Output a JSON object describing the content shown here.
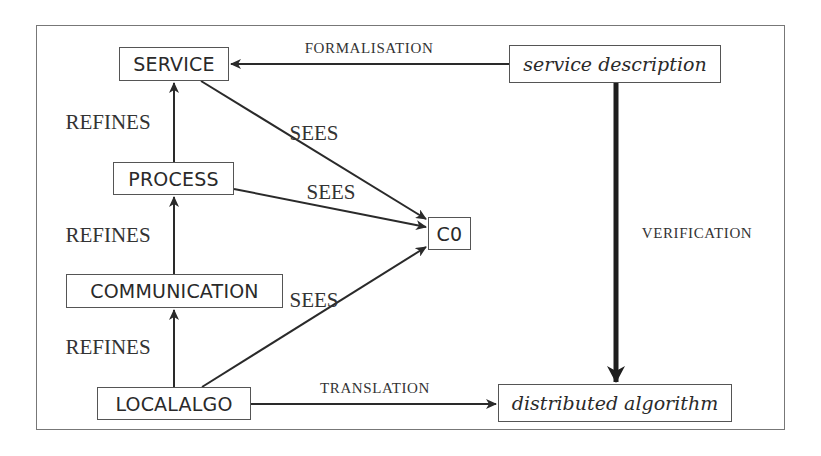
{
  "diagram": {
    "type": "refinement-architecture",
    "nodes": {
      "service": "SERVICE",
      "process": "PROCESS",
      "communication": "COMMUNICATION",
      "localalgo": "LOCALALGO",
      "c0": "C0",
      "service_description": "service description",
      "distributed_algorithm": "distributed algorithm"
    },
    "edge_labels": {
      "refines_1": "REFINES",
      "refines_2": "REFINES",
      "refines_3": "REFINES",
      "sees_1": "SEES",
      "sees_2": "SEES",
      "sees_3": "SEES",
      "formalisation": "FORMALISATION",
      "verification": "VERIFICATION",
      "translation": "TRANSLATION"
    },
    "edges": [
      {
        "from": "PROCESS",
        "to": "SERVICE",
        "label": "REFINES"
      },
      {
        "from": "COMMUNICATION",
        "to": "PROCESS",
        "label": "REFINES"
      },
      {
        "from": "LOCALALGO",
        "to": "COMMUNICATION",
        "label": "REFINES"
      },
      {
        "from": "SERVICE",
        "to": "C0",
        "label": "SEES"
      },
      {
        "from": "PROCESS",
        "to": "C0",
        "label": "SEES"
      },
      {
        "from": "LOCALALGO",
        "to": "C0",
        "label": "SEES"
      },
      {
        "from": "service description",
        "to": "SERVICE",
        "label": "FORMALISATION"
      },
      {
        "from": "service description",
        "to": "distributed algorithm",
        "label": "VERIFICATION"
      },
      {
        "from": "LOCALALGO",
        "to": "distributed algorithm",
        "label": "TRANSLATION"
      }
    ],
    "colors": {
      "stroke": "#2a2a2a",
      "border": "#555555",
      "frame": "#777777",
      "text": "#2a2a2a"
    }
  }
}
